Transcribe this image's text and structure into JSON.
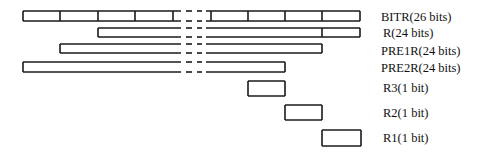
{
  "diagram": {
    "stroke_color": "#1a1a1a",
    "background": "#ffffff",
    "gap": {
      "break_start": 181,
      "break_end": 206,
      "dashes": [
        [
          186,
          192
        ],
        [
          197,
          202
        ]
      ]
    },
    "registers": [
      {
        "id": "bitr",
        "label": "BITR(26 bits)",
        "x1": 23,
        "x2": 360,
        "y": 11,
        "h": 10,
        "dividers": [
          60,
          98,
          135,
          173,
          211,
          248,
          285,
          322
        ],
        "label_x": 381,
        "label_y": 11
      },
      {
        "id": "r",
        "label": "R(24 bits)",
        "x1": 98,
        "x2": 360,
        "y": 28,
        "h": 9,
        "dividers": [
          322
        ],
        "label_x": 383,
        "label_y": 27
      },
      {
        "id": "pre1r",
        "label": "PRE1R(24 bits)",
        "x1": 60,
        "x2": 322,
        "y": 44,
        "h": 9,
        "dividers": [],
        "label_x": 381,
        "label_y": 45
      },
      {
        "id": "pre2r",
        "label": "PRE2R(24 bits)",
        "x1": 23,
        "x2": 285,
        "y": 62,
        "h": 10,
        "dividers": [],
        "label_x": 381,
        "label_y": 62
      },
      {
        "id": "r3",
        "label": "R3(1 bit)",
        "x1": 248,
        "x2": 285,
        "y": 81,
        "h": 15,
        "dividers": [],
        "label_x": 383,
        "label_y": 82
      },
      {
        "id": "r2",
        "label": "R2(1 bit)",
        "x1": 285,
        "x2": 322,
        "y": 105,
        "h": 15,
        "dividers": [],
        "label_x": 383,
        "label_y": 107
      },
      {
        "id": "r1",
        "label": "R1(1 bit)",
        "x1": 322,
        "x2": 361,
        "y": 130,
        "h": 16,
        "dividers": [],
        "label_x": 383,
        "label_y": 132
      }
    ]
  }
}
